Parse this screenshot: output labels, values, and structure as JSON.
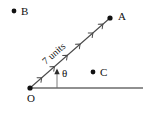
{
  "figure": {
    "type": "geometry-vector-diagram",
    "background_color": "#ffffff",
    "stroke_color": "#4a4a4a",
    "text_color": "#101010",
    "width": 155,
    "height": 114
  },
  "points": {
    "origin": {
      "label": "O",
      "x": 30,
      "y": 88,
      "label_x": 27,
      "label_y": 102
    },
    "a": {
      "label": "A",
      "x": 110,
      "y": 18,
      "label_x": 118,
      "label_y": 20
    },
    "b": {
      "label": "B",
      "x": 14,
      "y": 11,
      "label_x": 21,
      "label_y": 15
    },
    "c": {
      "label": "C",
      "x": 93,
      "y": 72,
      "label_x": 100,
      "label_y": 76
    }
  },
  "ray": {
    "name": "ray-OA",
    "from": "O",
    "to": "A",
    "length_label": "7 units",
    "label_rotation_deg": -41,
    "label_x": 56,
    "label_y": 56,
    "tick_count": 6
  },
  "baseline": {
    "name": "horizontal-reference-line",
    "x1": 30,
    "y1": 88,
    "x2": 143,
    "y2": 88
  },
  "angle": {
    "symbol": "θ",
    "label_x": 62,
    "label_y": 77,
    "vertex_x": 30,
    "vertex_y": 88,
    "marker_line_x": 57,
    "marker_line_top_y": 69,
    "marker_line_bottom_y": 88
  }
}
